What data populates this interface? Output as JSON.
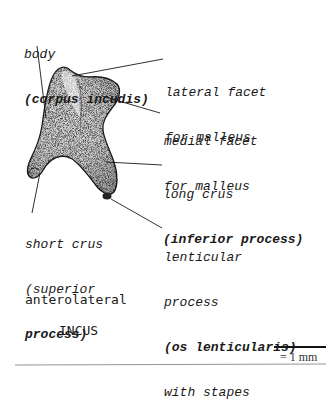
{
  "figure": {
    "title": "INCUS",
    "view": "anterolateral",
    "scale_bar": {
      "label": "= 1 mm"
    }
  },
  "labels": {
    "body": {
      "line1": "body",
      "line2": "(corpus incudis)"
    },
    "lateral_facet": {
      "line1": "lateral facet",
      "line2": "for malleus"
    },
    "medial_facet": {
      "line1": "medial facet",
      "line2": "for malleus"
    },
    "long_crus": {
      "line1": "long crus",
      "line2": "(inferior process)"
    },
    "short_crus": {
      "line1": "short crus",
      "line2": "(superior",
      "line3": "process)"
    },
    "lenticular": {
      "line1": "lenticular",
      "line2": "process",
      "line3": "(os lenticularis)",
      "line4": "with stapes"
    }
  },
  "colors": {
    "ink": "#1a1a1a",
    "bone_fill": "#c9c9c9",
    "background": "#ffffff"
  }
}
